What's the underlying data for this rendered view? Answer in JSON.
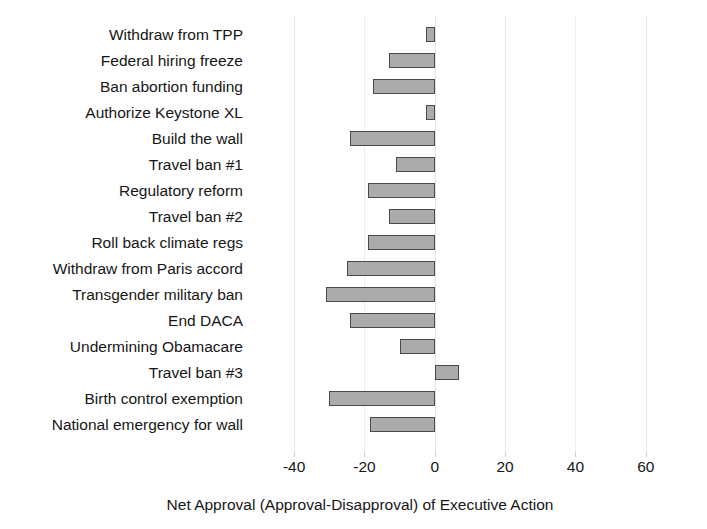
{
  "chart_data": {
    "type": "bar",
    "orientation": "horizontal",
    "title": "",
    "xlabel": "Net Approval (Approval-Disapproval) of Executive Action",
    "ylabel": "",
    "xlim": [
      -48,
      72
    ],
    "xticks": [
      -40,
      -20,
      0,
      20,
      40,
      60
    ],
    "xtick_labels": [
      "-40",
      "-20",
      "0",
      "20",
      "40",
      "60"
    ],
    "grid": true,
    "legend": null,
    "bar_fill_color": "#ababab",
    "bar_edge_color": "#4a4a4a",
    "categories": [
      "Withdraw from TPP",
      "Federal hiring freeze",
      "Ban abortion funding",
      "Authorize Keystone XL",
      "Build the wall",
      "Travel ban #1",
      "Regulatory reform",
      "Travel ban #2",
      "Roll back climate regs",
      "Withdraw from Paris accord",
      "Transgender military ban",
      "End DACA",
      "Undermining Obamacare",
      "Travel ban #3",
      "Birth control exemption",
      "National emergency for wall"
    ],
    "values": [
      -2.5,
      -13,
      -17.5,
      -2.5,
      -24,
      -11,
      -19,
      -13,
      -19,
      -25,
      -31,
      -24,
      -10,
      7,
      -30,
      -18.5
    ]
  }
}
